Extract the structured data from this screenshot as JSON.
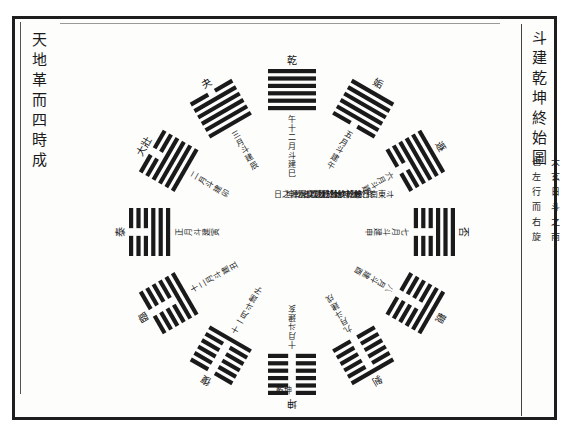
{
  "page": {
    "left_title": "天地革而四時成",
    "right_title": "斗建乾坤終始圖",
    "right_note_col1": "大玄日斗之南",
    "right_note_col2": "也左行而右旋"
  },
  "center": {
    "columns": [
      "斗東南日乾乾終於巳",
      "終於離坤始於離而",
      "終於坎離終於坎而",
      "始於坎坎者乾坤",
      "之交水源之日"
    ],
    "bottom_spoke": "坎十一月斗建子"
  },
  "hexagrams": [
    {
      "name": "乾",
      "lines": [
        1,
        1,
        1,
        1,
        1,
        1
      ],
      "angle": 0,
      "label": "乾",
      "spoke": "午十二月斗建巳"
    },
    {
      "name": "姤",
      "lines": [
        0,
        1,
        1,
        1,
        1,
        1
      ],
      "angle": 30,
      "label": "姤",
      "spoke": "五月斗建午"
    },
    {
      "name": "遯",
      "lines": [
        0,
        0,
        1,
        1,
        1,
        1
      ],
      "angle": 60,
      "label": "遯",
      "spoke": "六月斗建未"
    },
    {
      "name": "否",
      "lines": [
        0,
        0,
        0,
        1,
        1,
        1
      ],
      "angle": 90,
      "label": "否",
      "spoke": "七月斗建申"
    },
    {
      "name": "觀",
      "lines": [
        0,
        0,
        0,
        0,
        1,
        1
      ],
      "angle": 120,
      "label": "觀",
      "spoke": "八月斗建酉"
    },
    {
      "name": "剝",
      "lines": [
        0,
        0,
        0,
        0,
        0,
        1
      ],
      "angle": 150,
      "label": "剝",
      "spoke": "九月斗建戌"
    },
    {
      "name": "坤",
      "lines": [
        0,
        0,
        0,
        0,
        0,
        0
      ],
      "angle": 180,
      "label": "坤",
      "spoke": "十月斗建亥"
    },
    {
      "name": "復",
      "lines": [
        1,
        0,
        0,
        0,
        0,
        0
      ],
      "angle": 210,
      "label": "復",
      "spoke": "十一月斗建子"
    },
    {
      "name": "臨",
      "lines": [
        1,
        1,
        0,
        0,
        0,
        0
      ],
      "angle": 240,
      "label": "臨",
      "spoke": "十二月斗建丑"
    },
    {
      "name": "泰",
      "lines": [
        1,
        1,
        1,
        0,
        0,
        0
      ],
      "angle": 270,
      "label": "泰",
      "spoke": "正月斗建寅"
    },
    {
      "name": "大壯",
      "lines": [
        1,
        1,
        1,
        1,
        0,
        0
      ],
      "angle": 300,
      "label": "大壯",
      "spoke": "二月斗建卯"
    },
    {
      "name": "夬",
      "lines": [
        1,
        1,
        1,
        1,
        1,
        0
      ],
      "angle": 330,
      "label": "夬",
      "spoke": "三月斗建辰"
    }
  ],
  "bottom_caption": "乾坤",
  "colors": {
    "ink": "#1a1a1a",
    "frame": "#1e1e1e",
    "paper": "#fdfdfc"
  }
}
